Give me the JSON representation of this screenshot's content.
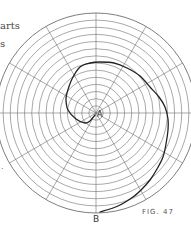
{
  "page_fragments": {
    "line_1": "arts",
    "line_2": "s",
    "line_3": "."
  },
  "figure": {
    "caption": "FIG. 47",
    "center_label": "A",
    "end_label": "B",
    "colors": {
      "grid": "#6e6e6e",
      "spiral": "#222222",
      "text": "#444444",
      "background": "#ffffff"
    },
    "polar_grid": {
      "center": [
        96,
        113
      ],
      "outer_radius": 100,
      "ring_count": 14,
      "radial_line_count": 12,
      "radial_angle_step_deg": 30
    },
    "spiral_points": [
      [
        95,
        115
      ],
      [
        90,
        121
      ],
      [
        85,
        123
      ],
      [
        76,
        119
      ],
      [
        68,
        110
      ],
      [
        66,
        100
      ],
      [
        67,
        93
      ],
      [
        72,
        79
      ],
      [
        80,
        67
      ],
      [
        90,
        63
      ],
      [
        100,
        62
      ],
      [
        114,
        63
      ],
      [
        127,
        68
      ],
      [
        140,
        76
      ],
      [
        150,
        87
      ],
      [
        159,
        97
      ],
      [
        165,
        107
      ],
      [
        168,
        119
      ],
      [
        168,
        130
      ],
      [
        166,
        144
      ],
      [
        163,
        157
      ],
      [
        157,
        169
      ],
      [
        150,
        180
      ],
      [
        142,
        189
      ],
      [
        133,
        197
      ],
      [
        118,
        206
      ],
      [
        100,
        212
      ]
    ]
  }
}
